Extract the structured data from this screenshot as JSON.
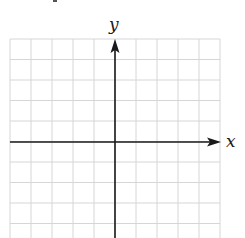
{
  "diagram": {
    "type": "coordinate-plane",
    "x_axis_label": "x",
    "y_axis_label": "y",
    "grid": {
      "columns": 10,
      "rows": 10,
      "left": 10,
      "top": 39,
      "cell_width": 21,
      "cell_height": 20.5,
      "line_color": "#d6d6d6"
    },
    "axes": {
      "color": "#1a1a1a",
      "origin_x": 115,
      "origin_y": 142,
      "x_arrow_direction": "right",
      "y_arrow_direction": "up"
    }
  }
}
